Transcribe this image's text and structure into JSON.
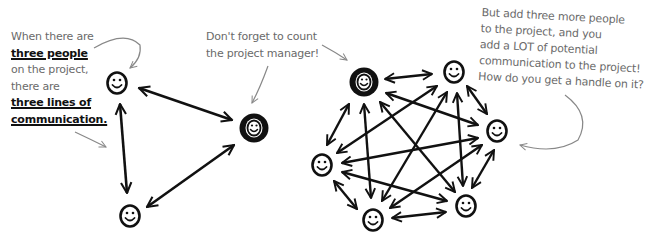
{
  "annotations": {
    "left": [
      {
        "text": "When there are",
        "emphasis": false
      },
      {
        "text": "three people",
        "emphasis": true
      },
      {
        "text": "on the project,",
        "emphasis": false
      },
      {
        "text": "there are",
        "emphasis": false
      },
      {
        "text": "three lines of",
        "emphasis": true
      },
      {
        "text": "communication.",
        "emphasis": true
      }
    ],
    "middle": [
      "Don't forget to count",
      "the project manager!"
    ],
    "right": [
      "But add three more people",
      "to the project, and you",
      "add a LOT of potential",
      "communication to the project!",
      "How do you get a handle on it?"
    ]
  },
  "diagrams": [
    {
      "name": "three-person-team",
      "nodes": [
        {
          "id": "member-1",
          "role": "team-member",
          "x": 117,
          "y": 83
        },
        {
          "id": "pm",
          "role": "project-manager",
          "x": 254,
          "y": 128
        },
        {
          "id": "member-2",
          "role": "team-member",
          "x": 130,
          "y": 216
        }
      ],
      "edges_count": 3
    },
    {
      "name": "six-person-team",
      "nodes": [
        {
          "id": "pm",
          "role": "project-manager",
          "x": 364,
          "y": 82
        },
        {
          "id": "member-tr",
          "role": "team-member",
          "x": 454,
          "y": 72
        },
        {
          "id": "member-r",
          "role": "team-member",
          "x": 497,
          "y": 131
        },
        {
          "id": "member-br",
          "role": "team-member",
          "x": 466,
          "y": 206
        },
        {
          "id": "member-b",
          "role": "team-member",
          "x": 373,
          "y": 220
        },
        {
          "id": "member-l",
          "role": "team-member",
          "x": 322,
          "y": 165
        }
      ],
      "edges_count": 15
    }
  ],
  "colors": {
    "ink": "#111111",
    "annotation": "#6a6a6a",
    "background": "#ffffff"
  }
}
